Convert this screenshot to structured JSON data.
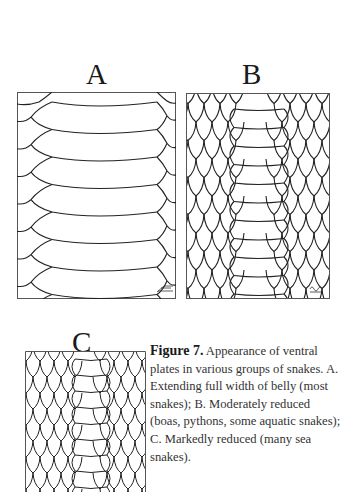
{
  "figure": {
    "panels": [
      {
        "id": "A",
        "label": "A"
      },
      {
        "id": "B",
        "label": "B"
      },
      {
        "id": "C",
        "label": "C"
      }
    ],
    "caption": {
      "figure_label": "Figure 7.",
      "text": " Appearance of ventral plates in various groups of snakes. A. Extending full width of belly (most snakes); B. Moderately reduced (boas, pythons, some aquatic snakes); C. Markedly reduced (many sea snakes)."
    }
  }
}
